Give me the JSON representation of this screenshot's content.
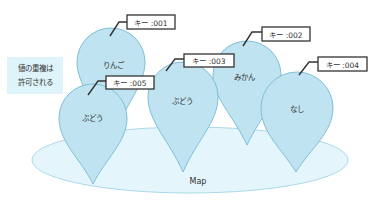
{
  "diagram": {
    "map_label": "Map",
    "note": {
      "lines": [
        "値の重複は",
        "許可される"
      ]
    },
    "colors": {
      "pin_fill": "#bfe3f1",
      "pin_stroke": "#7fbfd8",
      "map_fill": "#e4f5fb",
      "map_stroke": "#a9d9ea",
      "note_bg": "#dff3fa",
      "text": "#333333"
    },
    "entries": [
      {
        "key": "キー :001",
        "value": "りんご"
      },
      {
        "key": "キー :002",
        "value": "みかん"
      },
      {
        "key": "キー :003",
        "value": "ぶどう"
      },
      {
        "key": "キー :004",
        "value": "なし"
      },
      {
        "key": "キー :005",
        "value": "ぶどう"
      }
    ]
  }
}
